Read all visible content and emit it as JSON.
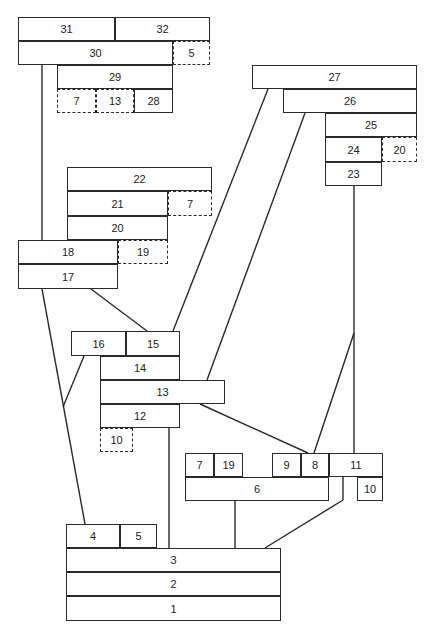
{
  "diagram": {
    "type": "harris-matrix",
    "line_color": "#2a2a2a",
    "units": [
      {
        "id": "31",
        "label": "31",
        "x": 18,
        "y": 17,
        "w": 97,
        "h": 24,
        "dashed": false
      },
      {
        "id": "32",
        "label": "32",
        "x": 115,
        "y": 17,
        "w": 95,
        "h": 24,
        "dashed": false
      },
      {
        "id": "30",
        "label": "30",
        "x": 18,
        "y": 41,
        "w": 155,
        "h": 24,
        "dashed": false
      },
      {
        "id": "5a",
        "label": "5",
        "x": 173,
        "y": 41,
        "w": 37,
        "h": 24,
        "dashed": true
      },
      {
        "id": "29",
        "label": "29",
        "x": 57,
        "y": 65,
        "w": 116,
        "h": 24,
        "dashed": false
      },
      {
        "id": "7a",
        "label": "7",
        "x": 57,
        "y": 89,
        "w": 39,
        "h": 24,
        "dashed": true
      },
      {
        "id": "13a",
        "label": "13",
        "x": 96,
        "y": 89,
        "w": 38,
        "h": 24,
        "dashed": true
      },
      {
        "id": "28",
        "label": "28",
        "x": 134,
        "y": 89,
        "w": 39,
        "h": 24,
        "dashed": false
      },
      {
        "id": "27",
        "label": "27",
        "x": 252,
        "y": 65,
        "w": 165,
        "h": 24,
        "dashed": false
      },
      {
        "id": "26",
        "label": "26",
        "x": 283,
        "y": 89,
        "w": 134,
        "h": 24,
        "dashed": false
      },
      {
        "id": "25",
        "label": "25",
        "x": 325,
        "y": 113,
        "w": 92,
        "h": 24,
        "dashed": false
      },
      {
        "id": "24",
        "label": "24",
        "x": 325,
        "y": 137,
        "w": 57,
        "h": 25,
        "dashed": false
      },
      {
        "id": "20a",
        "label": "20",
        "x": 382,
        "y": 137,
        "w": 35,
        "h": 25,
        "dashed": true
      },
      {
        "id": "23",
        "label": "23",
        "x": 325,
        "y": 162,
        "w": 57,
        "h": 24,
        "dashed": false
      },
      {
        "id": "22",
        "label": "22",
        "x": 67,
        "y": 167,
        "w": 145,
        "h": 24,
        "dashed": false
      },
      {
        "id": "21",
        "label": "21",
        "x": 67,
        "y": 191,
        "w": 101,
        "h": 25,
        "dashed": false
      },
      {
        "id": "7b",
        "label": "7",
        "x": 168,
        "y": 191,
        "w": 44,
        "h": 25,
        "dashed": true
      },
      {
        "id": "20",
        "label": "20",
        "x": 67,
        "y": 216,
        "w": 101,
        "h": 24,
        "dashed": false
      },
      {
        "id": "18",
        "label": "18",
        "x": 18,
        "y": 240,
        "w": 100,
        "h": 24,
        "dashed": false
      },
      {
        "id": "19a",
        "label": "19",
        "x": 118,
        "y": 240,
        "w": 50,
        "h": 24,
        "dashed": true
      },
      {
        "id": "17",
        "label": "17",
        "x": 18,
        "y": 264,
        "w": 100,
        "h": 25,
        "dashed": false
      },
      {
        "id": "16",
        "label": "16",
        "x": 71,
        "y": 331,
        "w": 55,
        "h": 25,
        "dashed": false
      },
      {
        "id": "15",
        "label": "15",
        "x": 126,
        "y": 331,
        "w": 54,
        "h": 25,
        "dashed": false
      },
      {
        "id": "14",
        "label": "14",
        "x": 100,
        "y": 356,
        "w": 80,
        "h": 24,
        "dashed": false
      },
      {
        "id": "13",
        "label": "13",
        "x": 100,
        "y": 380,
        "w": 125,
        "h": 24,
        "dashed": false
      },
      {
        "id": "12",
        "label": "12",
        "x": 100,
        "y": 404,
        "w": 80,
        "h": 24,
        "dashed": false
      },
      {
        "id": "10a",
        "label": "10",
        "x": 100,
        "y": 428,
        "w": 33,
        "h": 24,
        "dashed": true
      },
      {
        "id": "7",
        "label": "7",
        "x": 185,
        "y": 453,
        "w": 29,
        "h": 24,
        "dashed": false
      },
      {
        "id": "19",
        "label": "19",
        "x": 214,
        "y": 453,
        "w": 29,
        "h": 24,
        "dashed": false
      },
      {
        "id": "9",
        "label": "9",
        "x": 272,
        "y": 453,
        "w": 29,
        "h": 24,
        "dashed": false
      },
      {
        "id": "8",
        "label": "8",
        "x": 301,
        "y": 453,
        "w": 28,
        "h": 24,
        "dashed": false
      },
      {
        "id": "11",
        "label": "11",
        "x": 329,
        "y": 453,
        "w": 54,
        "h": 24,
        "dashed": false
      },
      {
        "id": "6",
        "label": "6",
        "x": 185,
        "y": 477,
        "w": 144,
        "h": 24,
        "dashed": false
      },
      {
        "id": "10",
        "label": "10",
        "x": 357,
        "y": 477,
        "w": 26,
        "h": 24,
        "dashed": false
      },
      {
        "id": "4",
        "label": "4",
        "x": 66,
        "y": 524,
        "w": 54,
        "h": 24,
        "dashed": false
      },
      {
        "id": "5",
        "label": "5",
        "x": 120,
        "y": 524,
        "w": 37,
        "h": 24,
        "dashed": false
      },
      {
        "id": "3",
        "label": "3",
        "x": 66,
        "y": 548,
        "w": 215,
        "h": 24,
        "dashed": false
      },
      {
        "id": "2",
        "label": "2",
        "x": 66,
        "y": 572,
        "w": 215,
        "h": 24,
        "dashed": false
      },
      {
        "id": "1",
        "label": "1",
        "x": 66,
        "y": 596,
        "w": 215,
        "h": 25,
        "dashed": false
      }
    ],
    "links": [
      {
        "x1": 42,
        "y1": 65,
        "x2": 42,
        "y2": 240
      },
      {
        "x1": 268,
        "y1": 89,
        "x2": 173,
        "y2": 331
      },
      {
        "x1": 305,
        "y1": 113,
        "x2": 207,
        "y2": 380
      },
      {
        "x1": 354,
        "y1": 186,
        "x2": 354,
        "y2": 453
      },
      {
        "x1": 354,
        "y1": 333,
        "x2": 314,
        "y2": 453
      },
      {
        "x1": 200,
        "y1": 404,
        "x2": 308,
        "y2": 453
      },
      {
        "x1": 91,
        "y1": 289,
        "x2": 147,
        "y2": 331
      },
      {
        "x1": 42,
        "y1": 289,
        "x2": 85,
        "y2": 524
      },
      {
        "x1": 84,
        "y1": 356,
        "x2": 63,
        "y2": 407
      },
      {
        "x1": 169,
        "y1": 428,
        "x2": 169,
        "y2": 548
      },
      {
        "x1": 235,
        "y1": 501,
        "x2": 235,
        "y2": 548
      },
      {
        "x1": 343,
        "y1": 477,
        "x2": 343,
        "y2": 500
      },
      {
        "x1": 343,
        "y1": 500,
        "x2": 265,
        "y2": 548
      }
    ]
  }
}
